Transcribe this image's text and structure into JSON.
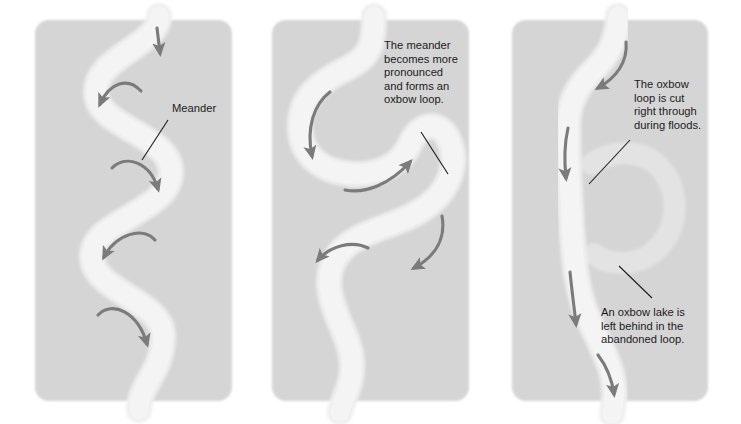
{
  "figure": {
    "title_visible": false,
    "background_color": "#ffffff",
    "panel_color": "#d5d5d5",
    "river_color": "#eeeeee",
    "oxbow_lake_color": "#e2e2e2",
    "arrow_color": "#7b7b7b",
    "text_color": "#1b1b1b",
    "leader_line_color": "#1b1b1b",
    "panel_count": 3
  },
  "panels": [
    {
      "id": "panel-1",
      "name": "meander-stage",
      "x": 35,
      "y": 20,
      "width": 197,
      "height": 381,
      "annotations": [
        {
          "id": "annotation-meander",
          "lines": [
            "Meander"
          ],
          "text_x": 172,
          "text_y": 112,
          "leader": {
            "x1": 168,
            "y1": 120,
            "x2": 142,
            "y2": 160
          }
        }
      ],
      "flow_arrows": 4
    },
    {
      "id": "panel-2",
      "name": "oxbow-loop-stage",
      "x": 272,
      "y": 20,
      "width": 197,
      "height": 381,
      "annotations": [
        {
          "id": "annotation-oxbow-loop-forms",
          "lines": [
            "The meander",
            "becomes more",
            "pronounced",
            "and forms an",
            "oxbow loop."
          ],
          "text_x": 384,
          "text_y": 49,
          "leader": {
            "x1": 421,
            "y1": 132,
            "x2": 448,
            "y2": 174
          }
        }
      ],
      "flow_arrows": 4
    },
    {
      "id": "panel-3",
      "name": "oxbow-lake-stage",
      "x": 512,
      "y": 20,
      "width": 196,
      "height": 381,
      "annotations": [
        {
          "id": "annotation-loop-cut-through",
          "lines": [
            "The oxbow",
            "loop is cut",
            "right through",
            "during floods."
          ],
          "text_x": 634,
          "text_y": 88,
          "leader": {
            "x1": 630,
            "y1": 140,
            "x2": 589,
            "y2": 184
          }
        },
        {
          "id": "annotation-oxbow-lake-left",
          "lines": [
            "An oxbow lake is",
            "left behind in the",
            "abandoned loop."
          ],
          "text_x": 601,
          "text_y": 316,
          "leader": {
            "x1": 652,
            "y1": 298,
            "x2": 619,
            "y2": 266
          }
        }
      ],
      "flow_arrows": 4,
      "has_oxbow_lake": true
    }
  ]
}
